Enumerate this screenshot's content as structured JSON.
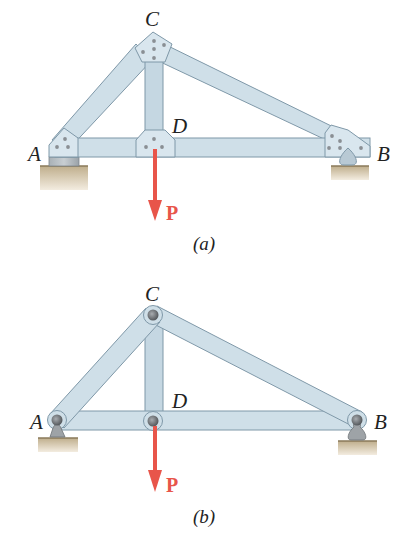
{
  "colors": {
    "member_fill": "#cfdfe8",
    "member_stroke": "#7f98a8",
    "gusset_fill": "#d9e6ee",
    "bolt": "#8a8f94",
    "pin": "#6e7276",
    "ground": "#cdbb9a",
    "load": "#e8554a",
    "label": "#222222"
  },
  "figures": [
    {
      "id": "a",
      "caption": "(a)",
      "type": "riveted truss with gusset plates",
      "joints": {
        "A": "A",
        "B": "B",
        "C": "C",
        "D": "D"
      },
      "load_label": "P",
      "supports": {
        "left": "fixed block on ground",
        "right": "rocker on ground"
      }
    },
    {
      "id": "b",
      "caption": "(b)",
      "type": "pin-connected truss idealization",
      "joints": {
        "A": "A",
        "B": "B",
        "C": "C",
        "D": "D"
      },
      "load_label": "P",
      "supports": {
        "left": "pin support",
        "right": "roller/rocker support"
      }
    }
  ],
  "members": [
    "AC",
    "CD",
    "CB",
    "AD",
    "DB"
  ]
}
